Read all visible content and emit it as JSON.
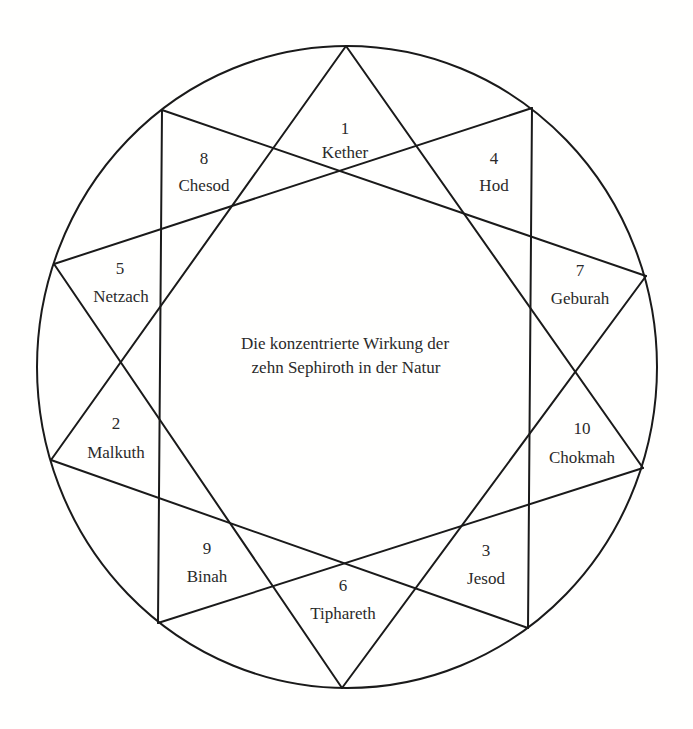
{
  "diagram": {
    "type": "ten-pointed star (decagram) inscribed in a circle",
    "center_caption": {
      "line1": "Die konzentrierte Wirkung der",
      "line2": "zehn Sephiroth in der Natur"
    },
    "sephiroth": [
      {
        "number": "1",
        "name": "Kether",
        "position": "top"
      },
      {
        "number": "8",
        "name": "Chesod",
        "position": "upper-left"
      },
      {
        "number": "4",
        "name": "Hod",
        "position": "upper-right"
      },
      {
        "number": "5",
        "name": "Netzach",
        "position": "left-upper"
      },
      {
        "number": "7",
        "name": "Geburah",
        "position": "right-upper"
      },
      {
        "number": "2",
        "name": "Malkuth",
        "position": "left-lower"
      },
      {
        "number": "10",
        "name": "Chokmah",
        "position": "right-lower"
      },
      {
        "number": "9",
        "name": "Binah",
        "position": "lower-left"
      },
      {
        "number": "3",
        "name": "Jesod",
        "position": "lower-right"
      },
      {
        "number": "6",
        "name": "Tiphareth",
        "position": "bottom"
      }
    ],
    "colors": {
      "line": "#1a1a1a",
      "text": "#2a2a2a",
      "background": "#ffffff"
    }
  }
}
